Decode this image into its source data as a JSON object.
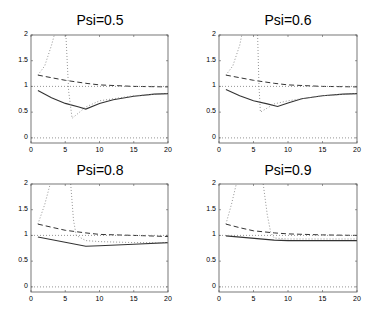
{
  "chart_data": [
    {
      "type": "line",
      "title": "Psi=0.5",
      "xlim": [
        0,
        20
      ],
      "ylim": [
        -0.1,
        2
      ],
      "xticks": [
        0,
        5,
        10,
        15,
        20
      ],
      "yticks": [
        0,
        0.5,
        1,
        1.5,
        2
      ],
      "xlabel": "",
      "ylabel": "",
      "series": [
        {
          "name": "solid",
          "style": "solid",
          "x": [
            1,
            3,
            5,
            7,
            8,
            10,
            12,
            15,
            18,
            20
          ],
          "values": [
            0.92,
            0.78,
            0.67,
            0.6,
            0.56,
            0.67,
            0.74,
            0.81,
            0.85,
            0.86
          ]
        },
        {
          "name": "dashed",
          "style": "dashed",
          "x": [
            1,
            3,
            5,
            8,
            10,
            15,
            20
          ],
          "values": [
            1.22,
            1.17,
            1.12,
            1.06,
            1.03,
            1.0,
            0.99
          ]
        },
        {
          "name": "dotted-upper",
          "style": "dotted",
          "x": [
            1,
            2,
            3,
            3.4
          ],
          "values": [
            1.22,
            1.4,
            1.8,
            2.0
          ]
        },
        {
          "name": "dotted-lower",
          "style": "dotted",
          "x": [
            5.1,
            5.5,
            6,
            8,
            10,
            15,
            20
          ],
          "values": [
            2.0,
            0.9,
            0.38,
            0.6,
            0.72,
            0.82,
            0.86
          ]
        },
        {
          "name": "ref-one",
          "style": "dotted",
          "x": [
            0,
            20
          ],
          "values": [
            1,
            1
          ]
        },
        {
          "name": "ref-zero",
          "style": "dotted",
          "x": [
            0,
            20
          ],
          "values": [
            0,
            0
          ]
        }
      ]
    },
    {
      "type": "line",
      "title": "Psi=0.6",
      "xlim": [
        0,
        20
      ],
      "ylim": [
        -0.1,
        2
      ],
      "xticks": [
        0,
        5,
        10,
        15,
        20
      ],
      "yticks": [
        0,
        0.5,
        1,
        1.5,
        2
      ],
      "xlabel": "",
      "ylabel": "",
      "series": [
        {
          "name": "solid",
          "style": "solid",
          "x": [
            1,
            3,
            5,
            7,
            8.5,
            10,
            12,
            15,
            18,
            20
          ],
          "values": [
            0.94,
            0.82,
            0.72,
            0.66,
            0.61,
            0.68,
            0.76,
            0.82,
            0.85,
            0.86
          ]
        },
        {
          "name": "dashed",
          "style": "dashed",
          "x": [
            1,
            3,
            5,
            8,
            10,
            15,
            20
          ],
          "values": [
            1.22,
            1.17,
            1.12,
            1.06,
            1.03,
            1.0,
            0.99
          ]
        },
        {
          "name": "dotted-upper",
          "style": "dotted",
          "x": [
            1,
            2,
            3,
            3.3
          ],
          "values": [
            1.22,
            1.4,
            1.8,
            2.0
          ]
        },
        {
          "name": "dotted-lower",
          "style": "dotted",
          "x": [
            5.6,
            5.8,
            6,
            8,
            10,
            15,
            20
          ],
          "values": [
            2.0,
            1.0,
            0.5,
            0.66,
            0.72,
            0.82,
            0.86
          ]
        },
        {
          "name": "ref-one",
          "style": "dotted",
          "x": [
            0,
            20
          ],
          "values": [
            1,
            1
          ]
        },
        {
          "name": "ref-zero",
          "style": "dotted",
          "x": [
            0,
            20
          ],
          "values": [
            0,
            0
          ]
        }
      ]
    },
    {
      "type": "line",
      "title": "Psi=0.8",
      "xlim": [
        0,
        20
      ],
      "ylim": [
        -0.1,
        2
      ],
      "xticks": [
        0,
        5,
        10,
        15,
        20
      ],
      "yticks": [
        0,
        0.5,
        1,
        1.5,
        2
      ],
      "xlabel": "",
      "ylabel": "",
      "series": [
        {
          "name": "solid",
          "style": "solid",
          "x": [
            1,
            8,
            10,
            15,
            20
          ],
          "values": [
            0.97,
            0.79,
            0.8,
            0.83,
            0.86
          ]
        },
        {
          "name": "dashed",
          "style": "dashed",
          "x": [
            1,
            3,
            5,
            8,
            10,
            15,
            20
          ],
          "values": [
            1.22,
            1.16,
            1.1,
            1.05,
            1.02,
            1.0,
            0.98
          ]
        },
        {
          "name": "dotted-upper",
          "style": "dotted",
          "x": [
            1,
            2,
            2.8
          ],
          "values": [
            1.22,
            1.6,
            2.0
          ]
        },
        {
          "name": "dotted-lower",
          "style": "dotted",
          "x": [
            5.8,
            6.2,
            6.6,
            8,
            10,
            15,
            20
          ],
          "values": [
            2.0,
            1.3,
            1.0,
            0.9,
            0.88,
            0.86,
            0.86
          ]
        },
        {
          "name": "ref-one",
          "style": "dotted",
          "x": [
            0,
            20
          ],
          "values": [
            1,
            1
          ]
        },
        {
          "name": "ref-zero",
          "style": "dotted",
          "x": [
            0,
            20
          ],
          "values": [
            0,
            0
          ]
        }
      ]
    },
    {
      "type": "line",
      "title": "Psi=0.9",
      "xlim": [
        0,
        20
      ],
      "ylim": [
        -0.1,
        2
      ],
      "xticks": [
        0,
        5,
        10,
        15,
        20
      ],
      "yticks": [
        0,
        0.5,
        1,
        1.5,
        2
      ],
      "xlabel": "",
      "ylabel": "",
      "series": [
        {
          "name": "solid",
          "style": "solid",
          "x": [
            1,
            8,
            10,
            15,
            20
          ],
          "values": [
            0.99,
            0.91,
            0.9,
            0.9,
            0.9
          ]
        },
        {
          "name": "dashed",
          "style": "dashed",
          "x": [
            1,
            3,
            5,
            8,
            10,
            15,
            20
          ],
          "values": [
            1.22,
            1.15,
            1.09,
            1.05,
            1.03,
            1.01,
            1.0
          ]
        },
        {
          "name": "dotted-upper",
          "style": "dotted",
          "x": [
            1,
            1.8,
            2.5
          ],
          "values": [
            1.22,
            1.6,
            2.0
          ]
        },
        {
          "name": "dotted-lower",
          "style": "dotted",
          "x": [
            6.4,
            7,
            7.5,
            8,
            10,
            15,
            20
          ],
          "values": [
            2.0,
            1.4,
            1.05,
            0.95,
            0.93,
            0.93,
            0.93
          ]
        },
        {
          "name": "ref-one",
          "style": "dotted",
          "x": [
            0,
            20
          ],
          "values": [
            1,
            1
          ]
        },
        {
          "name": "ref-zero",
          "style": "dotted",
          "x": [
            0,
            20
          ],
          "values": [
            0,
            0
          ]
        }
      ]
    }
  ],
  "panels": {
    "p0": {
      "title": "Psi=0.5"
    },
    "p1": {
      "title": "Psi=0.6"
    },
    "p2": {
      "title": "Psi=0.8"
    },
    "p3": {
      "title": "Psi=0.9"
    }
  },
  "ticks": {
    "x": [
      "0",
      "5",
      "10",
      "15",
      "20"
    ],
    "y": [
      "0",
      "0.5",
      "1",
      "1.5",
      "2"
    ]
  },
  "colors": {
    "solid": "#333333",
    "dashed": "#333333",
    "dotted": "#888888",
    "axes": "#555555"
  }
}
